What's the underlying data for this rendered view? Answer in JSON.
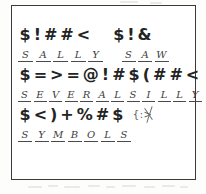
{
  "document": {
    "kind": "symbol-substitution-cipher-worksheet",
    "border_color": "#3a3a3a",
    "ink_color": "#232323",
    "handwriting_color": "#3d3d3d",
    "page_color": "#ffffff"
  },
  "puzzle": {
    "rows": [
      {
        "words": [
          {
            "cipher": [
              "$",
              "!",
              "#",
              "#",
              "<"
            ],
            "answer": [
              "S",
              "A",
              "L",
              "L",
              "Y"
            ],
            "answer_text": "SALLY"
          },
          {
            "cipher": [
              "$",
              "!",
              "&"
            ],
            "answer": [
              "S",
              "A",
              "W"
            ],
            "answer_text": "SAW"
          }
        ]
      },
      {
        "words": [
          {
            "cipher": [
              "$",
              "=",
              ">",
              "=",
              "@",
              "!",
              "#"
            ],
            "answer": [
              "S",
              "E",
              "V",
              "E",
              "R",
              "A",
              "L"
            ],
            "answer_text": "SEVERAL"
          },
          {
            "cipher": [
              "$",
              "(",
              "#",
              "#",
              "<"
            ],
            "answer": [
              "S",
              "I",
              "L",
              "L",
              "Y"
            ],
            "answer_text": "SILLY"
          }
        ]
      },
      {
        "words": [
          {
            "cipher": [
              "$",
              "<",
              ")",
              "+",
              "%",
              "#",
              "$"
            ],
            "answer": [
              "S",
              "Y",
              "M",
              "B",
              "O",
              "L",
              "S"
            ],
            "answer_text": "SYMBOLS"
          }
        ],
        "stray_mark": "{:>"
      }
    ],
    "decoded_sentence": "SALLY SAW SEVERAL SILLY SYMBOLS"
  }
}
